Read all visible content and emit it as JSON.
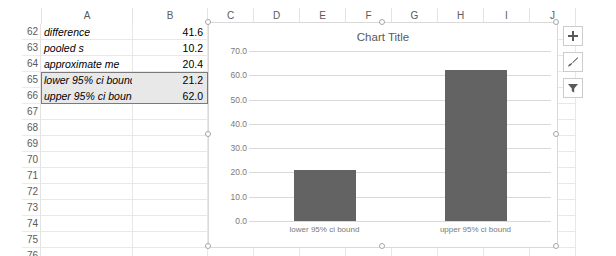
{
  "app": {
    "name": "spreadsheet-chart-view"
  },
  "sheet": {
    "columns": [
      "A",
      "B",
      "C",
      "D",
      "E",
      "F",
      "G",
      "H",
      "I",
      "J"
    ],
    "rows": [
      62,
      63,
      64,
      65,
      66,
      67,
      68,
      69,
      70,
      71,
      72,
      73,
      74,
      75,
      76
    ],
    "cells": [
      {
        "row": 62,
        "a": "difference",
        "b": "41.6",
        "selected": false
      },
      {
        "row": 63,
        "a": "pooled s",
        "b": "10.2",
        "selected": false
      },
      {
        "row": 64,
        "a": "approximate me",
        "b": "20.4",
        "selected": false
      },
      {
        "row": 65,
        "a": "lower 95% ci bound",
        "b": "21.2",
        "selected": true
      },
      {
        "row": 66,
        "a": "upper 95% ci bound",
        "b": "62.0",
        "selected": true
      },
      {
        "row": 67,
        "a": "",
        "b": "",
        "selected": false
      },
      {
        "row": 68,
        "a": "",
        "b": "",
        "selected": false
      },
      {
        "row": 69,
        "a": "",
        "b": "",
        "selected": false
      },
      {
        "row": 70,
        "a": "",
        "b": "",
        "selected": false
      },
      {
        "row": 71,
        "a": "",
        "b": "",
        "selected": false
      },
      {
        "row": 72,
        "a": "",
        "b": "",
        "selected": false
      },
      {
        "row": 73,
        "a": "",
        "b": "",
        "selected": false
      },
      {
        "row": 74,
        "a": "",
        "b": "",
        "selected": false
      },
      {
        "row": 75,
        "a": "",
        "b": "",
        "selected": false
      },
      {
        "row": 76,
        "a": "",
        "b": "",
        "selected": false
      }
    ],
    "selection_range": "A65:B66"
  },
  "chart_data": {
    "type": "bar",
    "title": "Chart Title",
    "categories": [
      "lower 95% ci bound",
      "upper 95% ci bound"
    ],
    "values": [
      21.2,
      62.0
    ],
    "xlabel": "",
    "ylabel": "",
    "ylim": [
      0.0,
      70.0
    ],
    "ytick_labels": [
      "70.0",
      "60.0",
      "50.0",
      "40.0",
      "30.0",
      "20.0",
      "10.0",
      "0.0"
    ],
    "ytick_values": [
      70.0,
      60.0,
      50.0,
      40.0,
      30.0,
      20.0,
      10.0,
      0.0
    ],
    "grid": true,
    "legend": false,
    "series_color": "#636363",
    "gridline_color": "#D9D9D9",
    "title_color": "#595959",
    "tick_color": "#7A7A7A"
  },
  "chart_buttons": [
    {
      "name": "chart-elements-button",
      "icon": "plus-icon",
      "label": "Chart Elements"
    },
    {
      "name": "chart-styles-button",
      "icon": "paintbrush-icon",
      "label": "Chart Styles"
    },
    {
      "name": "chart-filters-button",
      "icon": "funnel-icon",
      "label": "Chart Filters"
    }
  ]
}
